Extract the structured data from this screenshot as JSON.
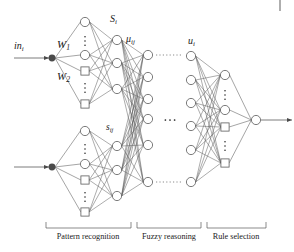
{
  "figure": {
    "type": "neural-network-architecture-diagram",
    "title": "",
    "background_color": "#ffffff",
    "stroke_color": "#5a5a5a",
    "text_color": "#1a1a1a",
    "node_fill": "#ffffff",
    "input_node_fill": "#4a4a4a"
  },
  "labels": {
    "input": "in",
    "input_sub": "i",
    "weight_1": "W",
    "weight_1_sub": "1",
    "weight_2": "W",
    "weight_2_sub": "2",
    "s_upper": "S",
    "s_upper_sub": "i",
    "mu": "μ",
    "mu_sub": "ij",
    "s_lower": "s",
    "s_lower_sub": "ij",
    "u": "u",
    "u_sub": "i"
  },
  "sections": [
    {
      "name": "pattern-recognition",
      "label": "Pattern recognition",
      "x_start": 46,
      "x_end": 131,
      "label_x": 88
    },
    {
      "name": "fuzzy-reasoning",
      "label": "Fuzzy reasoning",
      "x_start": 137,
      "x_end": 201,
      "label_x": 169
    },
    {
      "name": "rule-selection",
      "label": "Rule selection",
      "x_start": 207,
      "x_end": 266,
      "label_x": 236
    }
  ],
  "layers": {
    "input_nodes": [
      {
        "id": "in-top",
        "x": 52,
        "y": 58,
        "shape": "filled-circle",
        "r": 3.4
      },
      {
        "id": "in-bottom",
        "x": 52,
        "y": 167,
        "shape": "filled-circle",
        "r": 3.4
      }
    ],
    "pattern_upper": [
      {
        "shape": "circle",
        "x": 85,
        "y": 22
      },
      {
        "shape": "vdots",
        "x": 85,
        "y": 41
      },
      {
        "shape": "circle",
        "x": 85,
        "y": 55
      },
      {
        "shape": "square",
        "x": 85,
        "y": 71
      },
      {
        "shape": "vdots",
        "x": 85,
        "y": 88
      },
      {
        "shape": "square",
        "x": 85,
        "y": 104
      }
    ],
    "pattern_lower": [
      {
        "shape": "circle",
        "x": 85,
        "y": 131
      },
      {
        "shape": "vdots",
        "x": 85,
        "y": 149
      },
      {
        "shape": "circle",
        "x": 85,
        "y": 164
      },
      {
        "shape": "square",
        "x": 85,
        "y": 180
      },
      {
        "shape": "vdots",
        "x": 85,
        "y": 197
      },
      {
        "shape": "square",
        "x": 85,
        "y": 212
      }
    ],
    "s_upper_nodes": [
      {
        "shape": "circle",
        "x": 117,
        "y": 40
      },
      {
        "shape": "circle",
        "x": 117,
        "y": 63
      },
      {
        "shape": "circle",
        "x": 117,
        "y": 89
      }
    ],
    "s_lower_nodes": [
      {
        "shape": "circle",
        "x": 117,
        "y": 146
      },
      {
        "shape": "circle",
        "x": 117,
        "y": 170
      },
      {
        "shape": "circle",
        "x": 117,
        "y": 196
      }
    ],
    "mu_nodes": [
      {
        "shape": "circle",
        "x": 148,
        "y": 55
      },
      {
        "shape": "circle",
        "x": 148,
        "y": 77
      },
      {
        "shape": "circle",
        "x": 148,
        "y": 99
      },
      {
        "shape": "circle",
        "x": 148,
        "y": 119
      },
      {
        "shape": "circle",
        "x": 148,
        "y": 145
      },
      {
        "shape": "circle",
        "x": 148,
        "y": 182
      }
    ],
    "u_nodes": [
      {
        "shape": "circle",
        "x": 191,
        "y": 56
      },
      {
        "shape": "circle",
        "x": 191,
        "y": 80
      },
      {
        "shape": "circle",
        "x": 191,
        "y": 103
      },
      {
        "shape": "circle",
        "x": 191,
        "y": 126
      },
      {
        "shape": "circle",
        "x": 191,
        "y": 150
      },
      {
        "shape": "circle",
        "x": 191,
        "y": 182
      }
    ],
    "rule_nodes": [
      {
        "shape": "circle",
        "x": 225,
        "y": 75
      },
      {
        "shape": "vdots",
        "x": 225,
        "y": 95
      },
      {
        "shape": "circle",
        "x": 225,
        "y": 110
      },
      {
        "shape": "square",
        "x": 225,
        "y": 127
      },
      {
        "shape": "vdots",
        "x": 225,
        "y": 146
      },
      {
        "shape": "square",
        "x": 225,
        "y": 163
      }
    ],
    "output_node": {
      "shape": "circle",
      "x": 256,
      "y": 120
    }
  },
  "ellipses": {
    "mid_upper_dotted": {
      "x1": 156,
      "x2": 183,
      "y": 55
    },
    "mid_lower_dotted": {
      "x1": 156,
      "x2": 183,
      "y": 182
    },
    "mid_center_dots": {
      "x": 170,
      "y": 120
    }
  },
  "arrows": {
    "input_top": {
      "x1": 14,
      "x2": 49,
      "y": 58
    },
    "input_bottom": {
      "x1": 14,
      "x2": 49,
      "y": 167
    },
    "output": {
      "x1": 261,
      "x2": 292,
      "y": 120
    }
  }
}
